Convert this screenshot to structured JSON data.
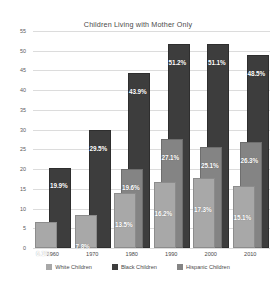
{
  "chart_data": {
    "type": "bar",
    "title": "Children Living with Mother Only",
    "xlabel": "",
    "ylabel": "",
    "categories": [
      "1960",
      "1970",
      "1980",
      "1990",
      "2000",
      "2010"
    ],
    "ylim": [
      0,
      55
    ],
    "yticks": [
      0,
      5,
      10,
      15,
      20,
      25,
      30,
      35,
      40,
      45,
      50,
      55
    ],
    "grid": true,
    "legend_position": "bottom",
    "series": [
      {
        "name": "White Children",
        "color": "#a8a8a8",
        "values": [
          6.1,
          7.8,
          13.5,
          16.2,
          17.3,
          15.1
        ],
        "labels": [
          "6.1%",
          "7.8%",
          "13.5%",
          "16.2%",
          "17.3%",
          "15.1%"
        ]
      },
      {
        "name": "Black Children",
        "color": "#3d3d3d",
        "values": [
          19.9,
          29.5,
          43.9,
          51.2,
          51.1,
          48.5
        ],
        "labels": [
          "19.9%",
          "29.5%",
          "43.9%",
          "51.2%",
          "51.1%",
          "48.5%"
        ]
      },
      {
        "name": "Hispanic Children",
        "color": "#848484",
        "values": [
          null,
          null,
          19.6,
          27.1,
          25.1,
          26.3
        ],
        "labels": [
          "",
          "",
          "19.6%",
          "27.1%",
          "25.1%",
          "26.3%"
        ]
      }
    ]
  },
  "legend": {
    "items": [
      {
        "label": "White Children",
        "color": "#a8a8a8"
      },
      {
        "label": "Black Children",
        "color": "#3d3d3d"
      },
      {
        "label": "Hispanic Children",
        "color": "#848484"
      }
    ]
  }
}
